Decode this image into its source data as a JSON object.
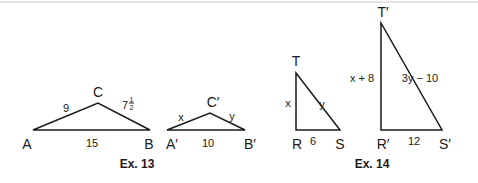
{
  "colors": {
    "stroke": "#1a1a1a",
    "background": "#ffffff"
  },
  "ex13": {
    "caption": "Ex. 13",
    "triangle_abc": {
      "vertices": {
        "A": "A",
        "B": "B",
        "C": "C"
      },
      "sides": {
        "AC": "9",
        "CB_whole": "7",
        "CB_num": "1",
        "CB_den": "2",
        "AB": "15"
      }
    },
    "triangle_abc_prime": {
      "vertices": {
        "A": "A′",
        "B": "B′",
        "C": "C′"
      },
      "sides": {
        "AC": "x",
        "CB": "y",
        "AB": "10"
      }
    }
  },
  "ex14": {
    "caption": "Ex. 14",
    "triangle_trs": {
      "vertices": {
        "T": "T",
        "R": "R",
        "S": "S"
      },
      "sides": {
        "TR": "x",
        "TS": "y",
        "RS": "6"
      }
    },
    "triangle_trs_prime": {
      "vertices": {
        "T": "T′",
        "R": "R′",
        "S": "S′"
      },
      "sides": {
        "TR": "x + 8",
        "TS": "3y − 10",
        "RS": "12"
      }
    }
  }
}
